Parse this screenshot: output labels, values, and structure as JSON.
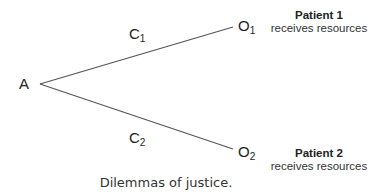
{
  "diagram": {
    "type": "decision-tree",
    "root": {
      "label": "A"
    },
    "branches": [
      {
        "choice": "C",
        "choice_sub": "1",
        "outcome": "O",
        "outcome_sub": "1",
        "outcome_title": "Patient 1",
        "outcome_desc": "receives resources"
      },
      {
        "choice": "C",
        "choice_sub": "2",
        "outcome": "O",
        "outcome_sub": "2",
        "outcome_title": "Patient 2",
        "outcome_desc": "receives resources"
      }
    ],
    "caption": "Dilemmas of justice.",
    "line_color": "#555555"
  }
}
